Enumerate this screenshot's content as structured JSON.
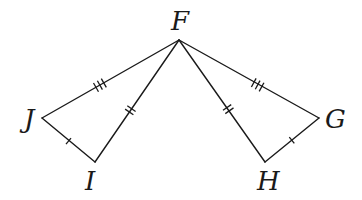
{
  "diagram": {
    "type": "congruent-triangles",
    "points": {
      "F": {
        "label": "F",
        "x": 179,
        "y": 40
      },
      "J": {
        "label": "J",
        "x": 42,
        "y": 118
      },
      "I": {
        "label": "I",
        "x": 95,
        "y": 162
      },
      "G": {
        "label": "G",
        "x": 319,
        "y": 118
      },
      "H": {
        "label": "H",
        "x": 265,
        "y": 162
      }
    },
    "labels": {
      "F": "F",
      "J": "J",
      "I": "I",
      "G": "G",
      "H": "H"
    },
    "triangles": [
      {
        "name": "FJI",
        "vertices": [
          "F",
          "J",
          "I"
        ]
      },
      {
        "name": "FGH",
        "vertices": [
          "F",
          "G",
          "H"
        ]
      }
    ],
    "segments": [
      {
        "from": "J",
        "to": "F",
        "ticks": 3
      },
      {
        "from": "F",
        "to": "I",
        "ticks": 2
      },
      {
        "from": "J",
        "to": "I",
        "ticks": 1
      },
      {
        "from": "F",
        "to": "G",
        "ticks": 3
      },
      {
        "from": "F",
        "to": "H",
        "ticks": 2
      },
      {
        "from": "H",
        "to": "G",
        "ticks": 1
      }
    ],
    "congruences": [
      "JF ≅ GF (3 ticks)",
      "FI ≅ FH (2 ticks)",
      "JI ≅ GH (1 tick)"
    ]
  }
}
